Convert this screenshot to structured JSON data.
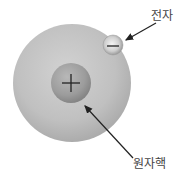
{
  "diagram": {
    "labels": {
      "electron": "전자",
      "nucleus": "원자핵"
    },
    "symbols": {
      "nucleus_charge": "+",
      "electron_charge": "−"
    },
    "colors": {
      "atom_fill": "#bdbdbd",
      "nucleus_fill": "#9a9a9a",
      "electron_fill": "#c8c8c8",
      "arrow": "#222222",
      "text": "#444444"
    }
  }
}
